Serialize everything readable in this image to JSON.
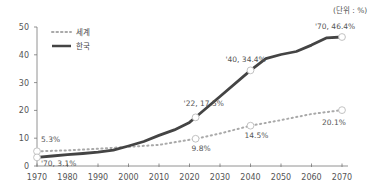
{
  "unit_label": "(단위 : %)",
  "colors": {
    "korea": "#444444",
    "world": "#a9a9a9",
    "axis": "#777777"
  },
  "chart_data": {
    "type": "line",
    "title": "",
    "xlabel": "",
    "ylabel": "",
    "unit": "(단위 : %)",
    "xlim": [
      1970,
      2070
    ],
    "ylim": [
      0,
      50
    ],
    "x_ticks": [
      1970,
      1980,
      1990,
      2000,
      2010,
      2020,
      2030,
      2040,
      2050,
      2060,
      2070
    ],
    "y_ticks": [
      0,
      10,
      20,
      30,
      40,
      50
    ],
    "grid": false,
    "legend_position": "top-left",
    "series": [
      {
        "name": "세계",
        "style": "dotted",
        "x": [
          1970,
          1980,
          1990,
          2000,
          2010,
          2022,
          2030,
          2040,
          2050,
          2060,
          2070
        ],
        "values": [
          5.3,
          5.6,
          6.2,
          6.9,
          7.6,
          9.8,
          11.7,
          14.5,
          16.5,
          18.7,
          20.1
        ]
      },
      {
        "name": "한국",
        "style": "solid",
        "x": [
          1970,
          1975,
          1980,
          1985,
          1990,
          1995,
          2000,
          2005,
          2010,
          2015,
          2020,
          2022,
          2030,
          2040,
          2045,
          2050,
          2055,
          2060,
          2065,
          2070
        ],
        "values": [
          3.1,
          3.6,
          4.1,
          4.5,
          5.0,
          5.7,
          7.2,
          8.8,
          11.0,
          13.0,
          15.7,
          17.5,
          25.0,
          34.4,
          38.6,
          40.1,
          41.2,
          43.5,
          46.1,
          46.4
        ]
      }
    ],
    "annotations": [
      {
        "text": "5.3%",
        "series": "세계",
        "x": 1970,
        "y": 5.3
      },
      {
        "text": "'70, 3.1%",
        "series": "한국",
        "x": 1970,
        "y": 3.1
      },
      {
        "text": "'22, 17.5%",
        "series": "한국",
        "x": 2022,
        "y": 17.5
      },
      {
        "text": "9.8%",
        "series": "세계",
        "x": 2022,
        "y": 9.8
      },
      {
        "text": "'40, 34.4%",
        "series": "한국",
        "x": 2040,
        "y": 34.4
      },
      {
        "text": "14.5%",
        "series": "세계",
        "x": 2040,
        "y": 14.5
      },
      {
        "text": "'70, 46.4%",
        "series": "한국",
        "x": 2070,
        "y": 46.4
      },
      {
        "text": "20.1%",
        "series": "세계",
        "x": 2070,
        "y": 20.1
      }
    ]
  },
  "legend": [
    {
      "label": "세계",
      "style": "dotted"
    },
    {
      "label": "한국",
      "style": "solid"
    }
  ]
}
